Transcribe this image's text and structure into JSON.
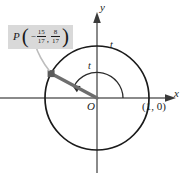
{
  "figure": {
    "axes": {
      "x_label": "x",
      "y_label": "y",
      "origin_label": "O"
    },
    "labels": {
      "arc_parameter": "t",
      "arc_length_on_circle": "t",
      "reference_point": "(1, 0)"
    },
    "point_p": {
      "name": "P",
      "open_bracket": "(",
      "close_bracket": ")",
      "comma": ",",
      "x_sign": "−",
      "x_numerator": "15",
      "x_denominator": "17",
      "y_numerator": "8",
      "y_denominator": "17"
    },
    "colors": {
      "axis": "#8a8a8a",
      "circle": "#1a1a1a",
      "radius": "#6e6e6e",
      "callout_background": "#d9d9d9",
      "leader": "#bdbdbd",
      "text": "#1a1a1a"
    },
    "geometry": {
      "center_x": 97,
      "center_y": 98,
      "radius": 52,
      "arc_radius": 26,
      "angle_degrees": 152
    }
  }
}
